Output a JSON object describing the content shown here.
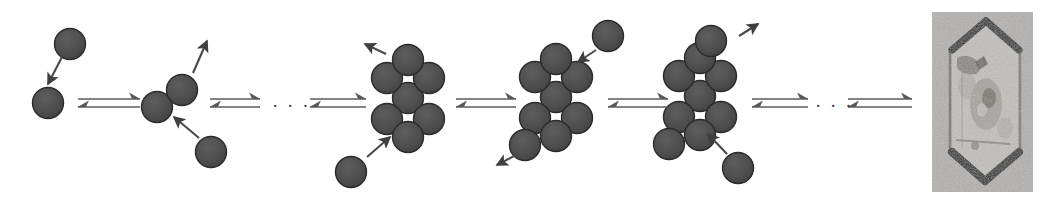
{
  "figure": {
    "type": "schematic-diagram",
    "width": 1051,
    "height": 203,
    "background_color": "#ffffff"
  },
  "style": {
    "monomer_fill": "#4c4c4c",
    "monomer_stroke": "#2b2b2b",
    "monomer_radius": 15.5,
    "arrow_color": "#4a4a4a",
    "equilibrium_arrow_color": "#5a5a5a",
    "photo_background": "#b0aeac",
    "photo_edge_color": "#1a1a1a"
  },
  "stages": [
    {
      "id": "stage-1-monomer",
      "label": "monomer",
      "particle_count": 1,
      "particles": [
        {
          "cx": 48,
          "cy": 103
        }
      ],
      "free_monomers": [
        {
          "cx": 70,
          "cy": 44
        }
      ],
      "attachment_arrows": [
        {
          "x1": 62,
          "y1": 57,
          "x2": 48,
          "y2": 84,
          "direction": "incoming"
        }
      ]
    },
    {
      "id": "stage-2-dimer",
      "label": "dimer",
      "particle_count": 2,
      "particles": [
        {
          "cx": 157,
          "cy": 107
        },
        {
          "cx": 182,
          "cy": 90
        }
      ],
      "free_monomers": [
        {
          "cx": 211,
          "cy": 152
        }
      ],
      "attachment_arrows": [
        {
          "x1": 193,
          "y1": 73,
          "x2": 207,
          "y2": 41,
          "direction": "outgoing"
        },
        {
          "x1": 199,
          "y1": 138,
          "x2": 174,
          "y2": 117,
          "direction": "incoming"
        }
      ]
    },
    {
      "id": "stage-3-heptamer",
      "label": "subcritical cluster",
      "particle_count": 7,
      "particles": [
        {
          "cx": 408,
          "cy": 98
        },
        {
          "cx": 387,
          "cy": 78
        },
        {
          "cx": 429,
          "cy": 78
        },
        {
          "cx": 387,
          "cy": 119
        },
        {
          "cx": 429,
          "cy": 119
        },
        {
          "cx": 408,
          "cy": 60
        },
        {
          "cx": 408,
          "cy": 137
        }
      ],
      "free_monomers": [
        {
          "cx": 351,
          "cy": 172
        }
      ],
      "attachment_arrows": [
        {
          "x1": 386,
          "y1": 54,
          "x2": 365,
          "y2": 44,
          "direction": "outgoing"
        },
        {
          "x1": 367,
          "y1": 157,
          "x2": 390,
          "y2": 137,
          "direction": "incoming"
        }
      ]
    },
    {
      "id": "stage-4-octamer",
      "label": "critical nucleus",
      "particle_count": 8,
      "particles": [
        {
          "cx": 556,
          "cy": 97
        },
        {
          "cx": 535,
          "cy": 77
        },
        {
          "cx": 577,
          "cy": 77
        },
        {
          "cx": 535,
          "cy": 118
        },
        {
          "cx": 577,
          "cy": 118
        },
        {
          "cx": 556,
          "cy": 59
        },
        {
          "cx": 556,
          "cy": 136
        },
        {
          "cx": 525,
          "cy": 145
        }
      ],
      "free_monomers": [
        {
          "cx": 608,
          "cy": 36
        }
      ],
      "attachment_arrows": [
        {
          "x1": 596,
          "y1": 50,
          "x2": 578,
          "y2": 62,
          "direction": "incoming"
        },
        {
          "x1": 516,
          "y1": 155,
          "x2": 497,
          "y2": 165,
          "direction": "outgoing"
        }
      ]
    },
    {
      "id": "stage-5-nonamer",
      "label": "supercritical nucleus",
      "particle_count": 9,
      "particles": [
        {
          "cx": 700,
          "cy": 96
        },
        {
          "cx": 679,
          "cy": 76
        },
        {
          "cx": 721,
          "cy": 76
        },
        {
          "cx": 679,
          "cy": 117
        },
        {
          "cx": 721,
          "cy": 117
        },
        {
          "cx": 700,
          "cy": 58
        },
        {
          "cx": 700,
          "cy": 135
        },
        {
          "cx": 669,
          "cy": 144
        },
        {
          "cx": 711,
          "cy": 41
        }
      ],
      "free_monomers": [
        {
          "cx": 738,
          "cy": 168
        }
      ],
      "attachment_arrows": [
        {
          "x1": 739,
          "y1": 36,
          "x2": 758,
          "y2": 24,
          "direction": "outgoing"
        },
        {
          "x1": 727,
          "y1": 154,
          "x2": 708,
          "y2": 134,
          "direction": "incoming"
        }
      ]
    },
    {
      "id": "stage-6-crystal",
      "label": "macroscopic crystal",
      "particle_count": null,
      "representation": "micrograph-photo",
      "photo": {
        "x": 932,
        "y": 12,
        "width": 101,
        "height": 180,
        "shape": "hexagonal-crystal"
      }
    }
  ],
  "equilibrium_arrows": [
    {
      "id": "eq-1",
      "x": 78,
      "y": 103,
      "width": 62
    },
    {
      "id": "eq-2",
      "x": 210,
      "y": 103,
      "width": 50
    },
    {
      "id": "eq-3",
      "x": 310,
      "y": 103,
      "width": 56
    },
    {
      "id": "eq-4",
      "x": 456,
      "y": 103,
      "width": 60
    },
    {
      "id": "eq-5",
      "x": 608,
      "y": 103,
      "width": 60
    },
    {
      "id": "eq-6",
      "x": 752,
      "y": 103,
      "width": 56
    },
    {
      "id": "eq-7",
      "x": 848,
      "y": 103,
      "width": 64
    }
  ],
  "ellipses": [
    {
      "id": "ellipsis-1",
      "text": "· · ·",
      "x": 272,
      "y": 96
    },
    {
      "id": "ellipsis-2",
      "text": "· · ·",
      "x": 815,
      "y": 96
    }
  ]
}
